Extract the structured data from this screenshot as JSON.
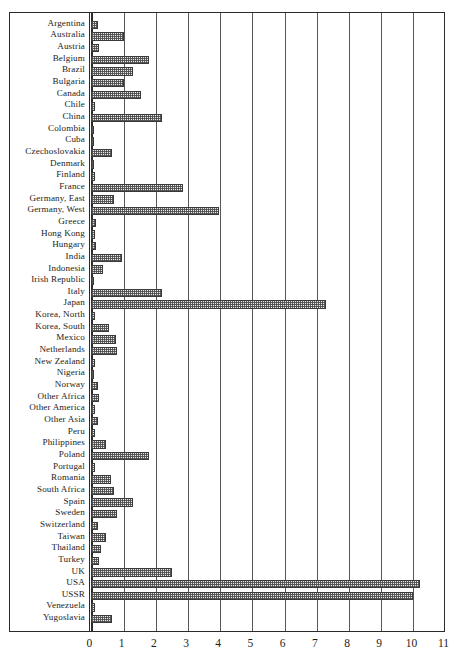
{
  "chart_data": {
    "type": "bar",
    "orientation": "horizontal",
    "title": "",
    "subtitle": "",
    "xlabel": "",
    "ylabel": "",
    "xlim": [
      0,
      11
    ],
    "xticks": [
      "0",
      "1",
      "2",
      "3",
      "4",
      "5",
      "6",
      "7",
      "8",
      "9",
      "10",
      "11"
    ],
    "grid": "vertical",
    "legend": "none",
    "bar_fill": "#e9e9e9",
    "bar_edge": "#3a3a3a",
    "bar_pattern": "dotted-crosshatch",
    "axis_color": "#2b2b2b",
    "categories": [
      "Argentina",
      "Australia",
      "Austria",
      "Belgium",
      "Brazil",
      "Bulgaria",
      "Canada",
      "Chile",
      "China",
      "Colombia",
      "Cuba",
      "Czechoslovakia",
      "Denmark",
      "Finland",
      "France",
      "Germany, East",
      "Germany, West",
      "Greece",
      "Hong Kong",
      "Hungary",
      "India",
      "Indonesia",
      "Irish Republic",
      "Italy",
      "Japan",
      "Korea, North",
      "Korea, South",
      "Mexico",
      "Netherlands",
      "New Zealand",
      "Nigeria",
      "Norway",
      "Other Africa",
      "Other America",
      "Other Asia",
      "Peru",
      "Philippines",
      "Poland",
      "Portugal",
      "Romania",
      "South Africa",
      "Spain",
      "Sweden",
      "Switzerland",
      "Taiwan",
      "Thailand",
      "Turkey",
      "UK",
      "USA",
      "USSR",
      "Venezuela",
      "Yugoslavia"
    ],
    "values": [
      0.2,
      1.0,
      0.25,
      1.8,
      1.3,
      1.0,
      1.55,
      0.1,
      2.2,
      0.08,
      0.03,
      0.65,
      0.08,
      0.1,
      2.85,
      0.7,
      3.95,
      0.15,
      0.1,
      0.15,
      0.95,
      0.35,
      0.05,
      2.2,
      7.3,
      0.1,
      0.55,
      0.75,
      0.8,
      0.1,
      0.07,
      0.2,
      0.25,
      0.1,
      0.2,
      0.1,
      0.45,
      1.8,
      0.1,
      0.6,
      0.7,
      1.3,
      0.8,
      0.2,
      0.45,
      0.3,
      0.25,
      2.5,
      10.2,
      10.0,
      0.1,
      0.65
    ]
  }
}
